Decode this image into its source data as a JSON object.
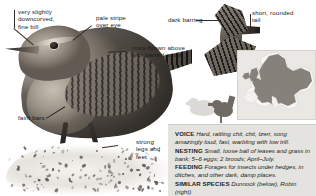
{
  "page": {
    "background": "#ffffff"
  },
  "annotations": [
    {
      "id": "bill",
      "name": "annotation-fine-bill",
      "text": "very slightly\ndowncurved,\nfine bill"
    },
    {
      "id": "supercilium",
      "name": "annotation-pale-stripe",
      "text": "pale stripe\nover eye"
    },
    {
      "id": "barring",
      "name": "annotation-dark-barring",
      "text": "dark barring"
    },
    {
      "id": "tail",
      "name": "annotation-short-tail",
      "text": "short, rounded\ntail"
    },
    {
      "id": "upperparts",
      "name": "annotation-rusty-brown",
      "text": "rusty-brown above\nwith barred wings"
    },
    {
      "id": "faintbars",
      "name": "annotation-faint-bars",
      "text": "faint bars"
    },
    {
      "id": "legs",
      "name": "annotation-strong-legs",
      "text": "strong\nlegs and\nfeet"
    }
  ],
  "fact_panel": {
    "rows": [
      {
        "key": "VOICE",
        "value": "Hard, rattling chit, chit, tzerr, song amazingly loud, fast, warbling with low trill."
      },
      {
        "key": "NESTING",
        "value": "Small, loose ball of leaves and grass in bank; 5–6 eggs; 2 broods; April–July."
      },
      {
        "key": "FEEDING",
        "value": "Forages for insects under hedges, in ditches, and other dark, damp places."
      },
      {
        "key": "SIMILAR SPECIES",
        "value": "Dunnock (below), Robin (right)."
      }
    ],
    "background_color": "#e4e3df"
  },
  "map": {
    "name": "europe-distribution-map",
    "sea_color": "#e9e8e4",
    "land_color": "#f7f6f3",
    "range_color": "#6a645c"
  },
  "silhouettes": [
    {
      "name": "silhouette-dunnock",
      "color": "#dcdad6"
    },
    {
      "name": "silhouette-wren",
      "color": "#6f6a63"
    }
  ],
  "illustrations": [
    {
      "name": "wren-photograph-perched"
    },
    {
      "name": "wren-illustration-flight"
    }
  ]
}
